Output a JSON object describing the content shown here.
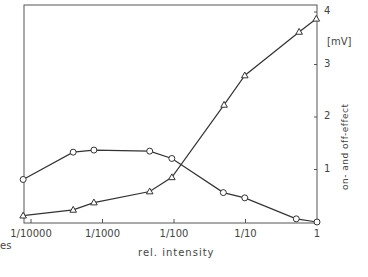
{
  "chart_data": {
    "type": "line",
    "title": "",
    "xlabel": "rel. intensity",
    "ylabel": "on- and off-effect",
    "yunit": "[mV]",
    "xscale": "log",
    "xlim_log10": [
      -4.2,
      0
    ],
    "ylim": [
      0,
      4
    ],
    "x_ticks": [
      {
        "label": "1/10000",
        "log10": -4
      },
      {
        "label": "1/1000",
        "log10": -3
      },
      {
        "label": "1/100",
        "log10": -2
      },
      {
        "label": "1/10",
        "log10": -1
      },
      {
        "label": "1",
        "log10": 0
      }
    ],
    "y_ticks": [
      "1",
      "2",
      "3",
      "4"
    ],
    "grid": false,
    "legend": null,
    "left_partial_label": "es",
    "series": [
      {
        "name": "circles",
        "marker": "circle",
        "x_log10": [
          -4.11,
          -3.41,
          -3.12,
          -2.34,
          -2.03,
          -1.31,
          -1.01,
          -0.29,
          0
        ],
        "values": [
          0.81,
          1.33,
          1.37,
          1.35,
          1.21,
          0.56,
          0.46,
          0.06,
          0.0
        ]
      },
      {
        "name": "triangles",
        "marker": "triangle",
        "x_log10": [
          -4.11,
          -3.41,
          -3.12,
          -2.34,
          -2.03,
          -1.3,
          -1.01,
          -0.25,
          -0.01
        ],
        "values": [
          0.12,
          0.23,
          0.37,
          0.58,
          0.85,
          2.23,
          2.79,
          3.62,
          3.87
        ]
      }
    ]
  }
}
